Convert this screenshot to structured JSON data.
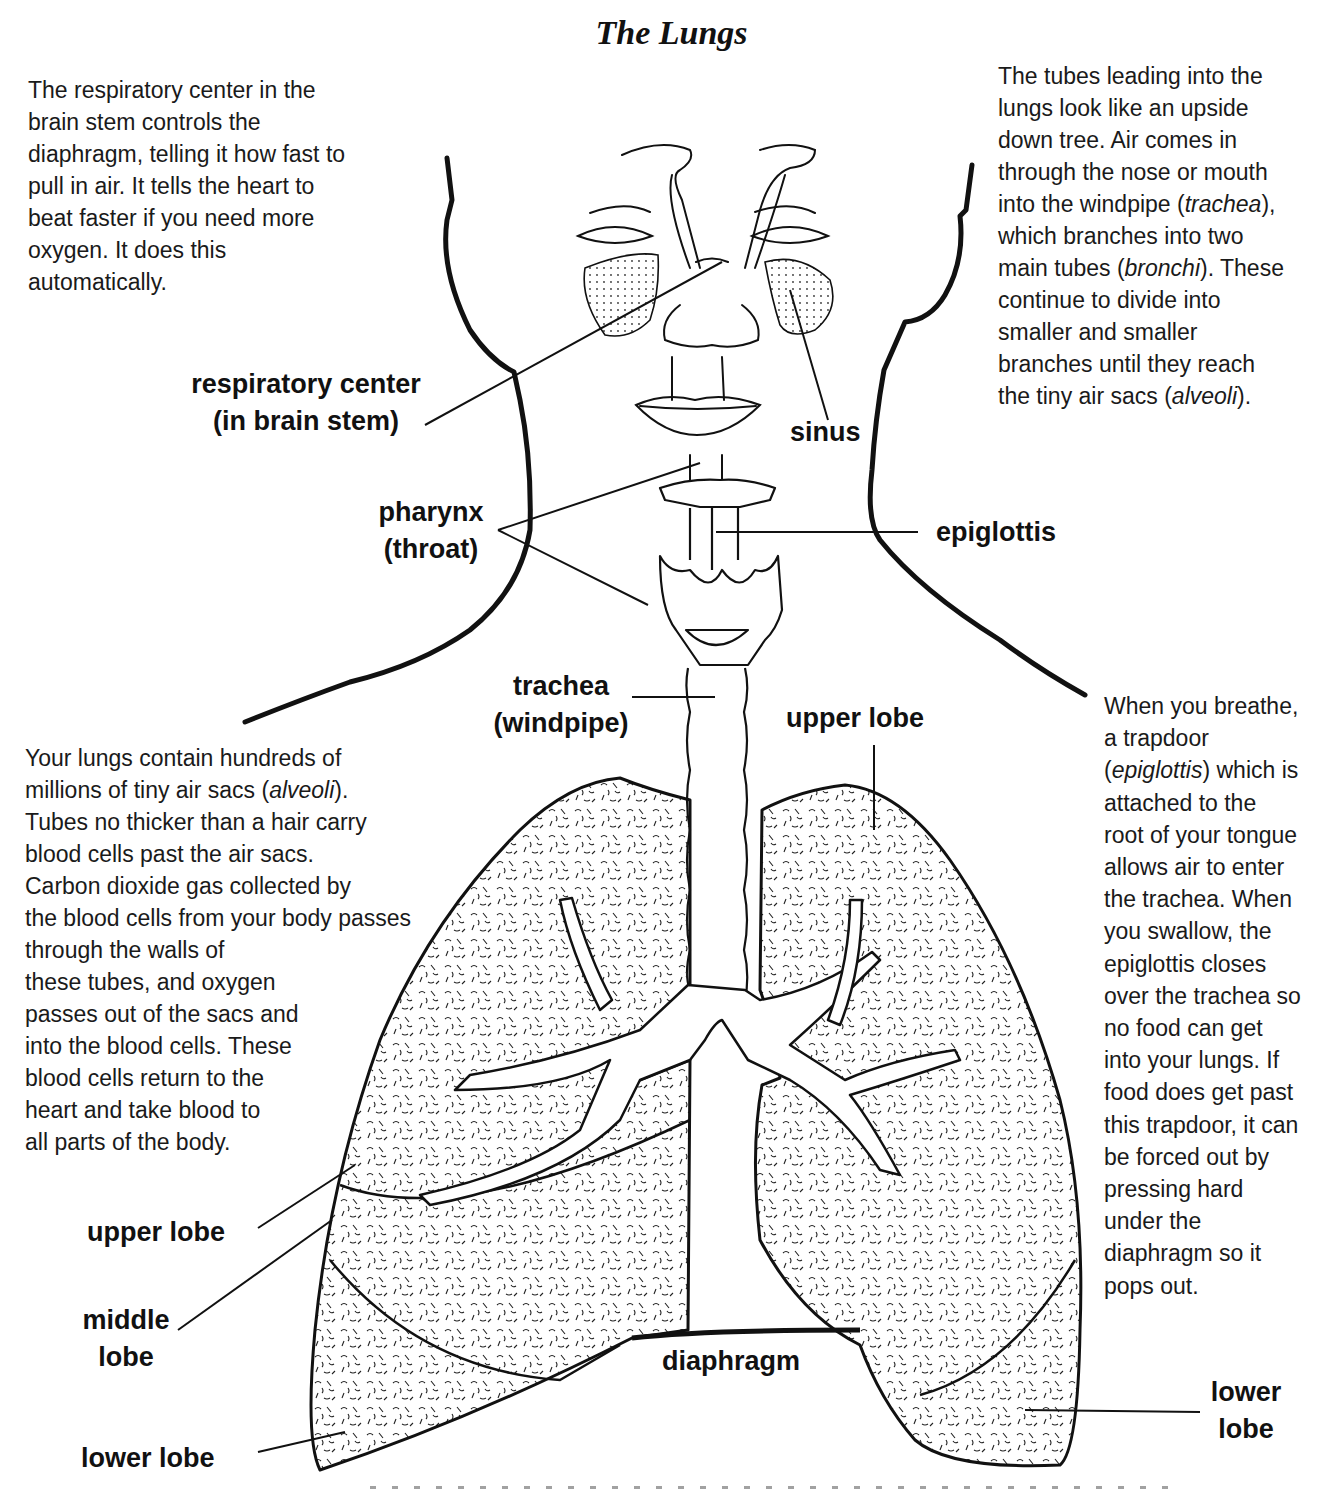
{
  "title": "The Lungs",
  "paragraphs": {
    "respiratory_center": [
      "The respiratory center in the",
      "brain stem controls the",
      "diaphragm, telling it how fast to",
      "pull in air.  It tells the heart to",
      "beat faster if you need more",
      "oxygen.  It does this",
      "automatically."
    ],
    "tubes": [
      {
        "pre": "The tubes leading into the",
        "it": "",
        "post": ""
      },
      {
        "pre": "lungs look like an upside",
        "it": "",
        "post": ""
      },
      {
        "pre": "down tree.  Air comes in",
        "it": "",
        "post": ""
      },
      {
        "pre": "through the nose or mouth",
        "it": "",
        "post": ""
      },
      {
        "pre": "into the windpipe (",
        "it": "trachea",
        "post": "),"
      },
      {
        "pre": "which branches into two",
        "it": "",
        "post": ""
      },
      {
        "pre": "main tubes (",
        "it": "bronchi",
        "post": ").  These"
      },
      {
        "pre": "continue to divide into",
        "it": "",
        "post": ""
      },
      {
        "pre": "smaller and smaller",
        "it": "",
        "post": ""
      },
      {
        "pre": "branches until they reach",
        "it": "",
        "post": ""
      },
      {
        "pre": "the tiny air sacs (",
        "it": "alveoli",
        "post": ")."
      }
    ],
    "alveoli": [
      {
        "pre": "Your lungs contain hundreds of",
        "it": "",
        "post": ""
      },
      {
        "pre": "millions of tiny air sacs (",
        "it": "alveoli",
        "post": ")."
      },
      {
        "pre": "Tubes no thicker than a hair carry",
        "it": "",
        "post": ""
      },
      {
        "pre": "blood cells past the air sacs.",
        "it": "",
        "post": ""
      },
      {
        "pre": "Carbon dioxide gas collected by",
        "it": "",
        "post": ""
      },
      {
        "pre": "the blood cells from your body passes",
        "it": "",
        "post": ""
      },
      {
        "pre": "through the walls of",
        "it": "",
        "post": ""
      },
      {
        "pre": "these tubes, and oxygen",
        "it": "",
        "post": ""
      },
      {
        "pre": "passes out of the sacs and",
        "it": "",
        "post": ""
      },
      {
        "pre": "into the blood cells.  These",
        "it": "",
        "post": ""
      },
      {
        "pre": "blood cells return to the",
        "it": "",
        "post": ""
      },
      {
        "pre": "heart and take blood to",
        "it": "",
        "post": ""
      },
      {
        "pre": "all parts of the body.",
        "it": "",
        "post": ""
      }
    ],
    "epiglottis": [
      {
        "pre": "When you breathe,",
        "it": "",
        "post": ""
      },
      {
        "pre": "a trapdoor",
        "it": "",
        "post": ""
      },
      {
        "pre": "(",
        "it": "epiglottis",
        "post": ") which is"
      },
      {
        "pre": "attached to the",
        "it": "",
        "post": ""
      },
      {
        "pre": "root of your tongue",
        "it": "",
        "post": ""
      },
      {
        "pre": "allows air to enter",
        "it": "",
        "post": ""
      },
      {
        "pre": "the trachea.  When",
        "it": "",
        "post": ""
      },
      {
        "pre": "you swallow, the",
        "it": "",
        "post": ""
      },
      {
        "pre": "epiglottis closes",
        "it": "",
        "post": ""
      },
      {
        "pre": "over the trachea so",
        "it": "",
        "post": ""
      },
      {
        "pre": "no food can get",
        "it": "",
        "post": ""
      },
      {
        "pre": "into your lungs.  If",
        "it": "",
        "post": ""
      },
      {
        "pre": "food does get past",
        "it": "",
        "post": ""
      },
      {
        "pre": "this trapdoor, it can",
        "it": "",
        "post": ""
      },
      {
        "pre": "be forced out by",
        "it": "",
        "post": ""
      },
      {
        "pre": "pressing hard",
        "it": "",
        "post": ""
      },
      {
        "pre": "under the",
        "it": "",
        "post": ""
      },
      {
        "pre": "diaphragm so it",
        "it": "",
        "post": ""
      },
      {
        "pre": "pops out.",
        "it": "",
        "post": ""
      }
    ]
  },
  "labels": {
    "respiratory_center": [
      "respiratory center",
      "(in brain stem)"
    ],
    "sinus": [
      "sinus"
    ],
    "pharynx": [
      "pharynx",
      "(throat)"
    ],
    "epiglottis": [
      "epiglottis"
    ],
    "trachea": [
      "trachea",
      "(windpipe)"
    ],
    "upper_lobe_right": [
      "upper lobe"
    ],
    "upper_lobe_left": [
      "upper lobe"
    ],
    "middle_lobe": [
      "middle",
      "lobe"
    ],
    "lower_lobe_left": [
      "lower lobe"
    ],
    "diaphragm": [
      "diaphragm"
    ],
    "lower_lobe_right": [
      "lower",
      "lobe"
    ]
  }
}
